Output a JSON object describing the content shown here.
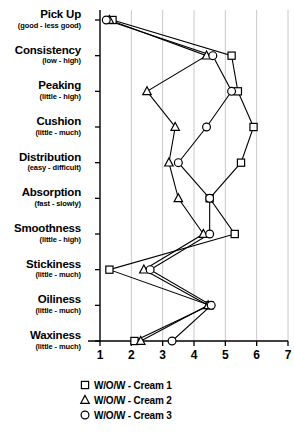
{
  "chart_data": {
    "type": "line",
    "title": "",
    "xlabel": "",
    "ylabel": "",
    "orientation": "horizontal",
    "xlim": [
      1,
      7
    ],
    "xticks": [
      1,
      2,
      3,
      4,
      5,
      6,
      7
    ],
    "xtick_labels": [
      "1",
      "2",
      "3",
      "4",
      "5",
      "6",
      "7"
    ],
    "grid": true,
    "grid_axis": "x",
    "legend_position": "bottom",
    "categories": [
      "Pick Up",
      "Consistency",
      "Peaking",
      "Cushion",
      "Distribution",
      "Absorption",
      "Smoothness",
      "Stickiness",
      "Oiliness",
      "Waxiness"
    ],
    "category_subtitles": [
      "(good - less good)",
      "(low - high)",
      "(little - high)",
      "(little - much)",
      "(easy - difficult)",
      "(fast - slowly)",
      "(little - high)",
      "(little - much)",
      "(little - much)",
      "(little - much)"
    ],
    "series": [
      {
        "name": "W/O/W - Cream 1",
        "marker": "square",
        "values": [
          1.4,
          5.2,
          5.4,
          5.9,
          5.5,
          4.5,
          5.3,
          1.3,
          4.5,
          2.1
        ]
      },
      {
        "name": "W/O/W - Cream 2",
        "marker": "triangle",
        "values": [
          1.3,
          4.4,
          2.5,
          3.4,
          3.2,
          3.5,
          4.3,
          2.4,
          4.45,
          2.3
        ]
      },
      {
        "name": "W/O/W - Cream 3",
        "marker": "circle",
        "values": [
          1.2,
          4.6,
          5.2,
          4.4,
          3.5,
          4.5,
          4.5,
          2.6,
          4.55,
          3.3
        ]
      }
    ]
  },
  "legend": {
    "items": [
      {
        "marker": "square",
        "label": "W/O/W - Cream 1"
      },
      {
        "marker": "triangle",
        "label": "W/O/W - Cream 2"
      },
      {
        "marker": "circle",
        "label": "W/O/W - Cream 3"
      }
    ]
  },
  "colors": {
    "line": "#000000",
    "marker_fill": "#ffffff",
    "grid": "#c8c8c8",
    "axis": "#000000",
    "background": "#ffffff"
  }
}
